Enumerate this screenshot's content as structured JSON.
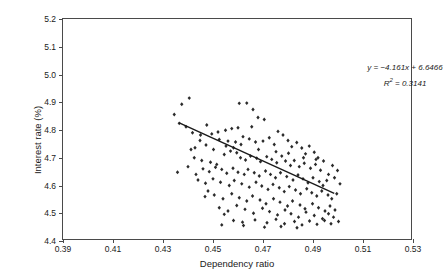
{
  "chart_data": {
    "type": "scatter",
    "title": "",
    "xlabel": "Dependency ratio",
    "ylabel": "Interest rate (%)",
    "xlim": [
      0.39,
      0.53
    ],
    "ylim": [
      4.4,
      5.2
    ],
    "xticks": [
      "0.39",
      "0.41",
      "0.43",
      "0.45",
      "0.47",
      "0.49",
      "0.51",
      "0.53"
    ],
    "xtick_values": [
      0.39,
      0.41,
      0.43,
      0.45,
      0.47,
      0.49,
      0.51,
      0.53
    ],
    "yticks": [
      "4.4",
      "4.5",
      "4.6",
      "4.7",
      "4.8",
      "4.9",
      "5.0",
      "5.1",
      "5.2"
    ],
    "ytick_values": [
      4.4,
      4.5,
      4.6,
      4.7,
      4.8,
      4.9,
      5.0,
      5.1,
      5.2
    ],
    "grid": false,
    "legend": "none",
    "marker": "filled-diamond",
    "marker_color": "#2b2b2b",
    "annotations": [
      "y = −4.161x + 6.6466",
      "R² = 0.3141"
    ],
    "equation": {
      "slope": -4.161,
      "intercept": 6.6466,
      "r_squared": 0.3141,
      "text_line1": "y = −4.161x + 6.6466",
      "text_line2_prefix": "R",
      "text_line2_sup": "2",
      "text_line2_suffix": " = 0.3141"
    },
    "trendline": {
      "color": "#1a1a1a",
      "x_start": 0.4365,
      "y_start": 4.826,
      "x_end": 0.4985,
      "y_end": 4.572
    },
    "points": [
      [
        0.4375,
        4.893
      ],
      [
        0.4405,
        4.915
      ],
      [
        0.4345,
        4.856
      ],
      [
        0.4365,
        4.824
      ],
      [
        0.4605,
        4.896
      ],
      [
        0.4635,
        4.897
      ],
      [
        0.466,
        4.874
      ],
      [
        0.468,
        4.845
      ],
      [
        0.4705,
        4.838
      ],
      [
        0.4655,
        4.812
      ],
      [
        0.46,
        4.808
      ],
      [
        0.4575,
        4.805
      ],
      [
        0.455,
        4.799
      ],
      [
        0.452,
        4.793
      ],
      [
        0.4495,
        4.786
      ],
      [
        0.4475,
        4.818
      ],
      [
        0.445,
        4.782
      ],
      [
        0.4525,
        4.766
      ],
      [
        0.456,
        4.76
      ],
      [
        0.459,
        4.757
      ],
      [
        0.462,
        4.776
      ],
      [
        0.4645,
        4.768
      ],
      [
        0.467,
        4.757
      ],
      [
        0.47,
        4.76
      ],
      [
        0.4725,
        4.772
      ],
      [
        0.4745,
        4.748
      ],
      [
        0.476,
        4.795
      ],
      [
        0.478,
        4.782
      ],
      [
        0.48,
        4.762
      ],
      [
        0.4815,
        4.74
      ],
      [
        0.4835,
        4.755
      ],
      [
        0.4855,
        4.735
      ],
      [
        0.487,
        4.714
      ],
      [
        0.4885,
        4.742
      ],
      [
        0.4905,
        4.72
      ],
      [
        0.492,
        4.7
      ],
      [
        0.4425,
        4.7
      ],
      [
        0.4455,
        4.69
      ],
      [
        0.449,
        4.684
      ],
      [
        0.4515,
        4.676
      ],
      [
        0.4545,
        4.712
      ],
      [
        0.457,
        4.724
      ],
      [
        0.4595,
        4.718
      ],
      [
        0.461,
        4.7
      ],
      [
        0.463,
        4.692
      ],
      [
        0.465,
        4.706
      ],
      [
        0.4675,
        4.698
      ],
      [
        0.469,
        4.686
      ],
      [
        0.4715,
        4.704
      ],
      [
        0.4735,
        4.694
      ],
      [
        0.4755,
        4.682
      ],
      [
        0.4775,
        4.706
      ],
      [
        0.479,
        4.688
      ],
      [
        0.481,
        4.672
      ],
      [
        0.4825,
        4.69
      ],
      [
        0.4845,
        4.668
      ],
      [
        0.4865,
        4.68
      ],
      [
        0.489,
        4.662
      ],
      [
        0.491,
        4.676
      ],
      [
        0.493,
        4.655
      ],
      [
        0.446,
        4.66
      ],
      [
        0.4485,
        4.65
      ],
      [
        0.451,
        4.666
      ],
      [
        0.4535,
        4.658
      ],
      [
        0.4555,
        4.644
      ],
      [
        0.458,
        4.662
      ],
      [
        0.46,
        4.648
      ],
      [
        0.4625,
        4.64
      ],
      [
        0.464,
        4.658
      ],
      [
        0.4665,
        4.646
      ],
      [
        0.4685,
        4.634
      ],
      [
        0.471,
        4.652
      ],
      [
        0.473,
        4.64
      ],
      [
        0.475,
        4.628
      ],
      [
        0.477,
        4.646
      ],
      [
        0.4795,
        4.632
      ],
      [
        0.482,
        4.62
      ],
      [
        0.484,
        4.638
      ],
      [
        0.486,
        4.624
      ],
      [
        0.488,
        4.61
      ],
      [
        0.49,
        4.628
      ],
      [
        0.4925,
        4.614
      ],
      [
        0.494,
        4.6
      ],
      [
        0.4955,
        4.618
      ],
      [
        0.444,
        4.62
      ],
      [
        0.447,
        4.608
      ],
      [
        0.45,
        4.624
      ],
      [
        0.453,
        4.612
      ],
      [
        0.4565,
        4.6
      ],
      [
        0.4585,
        4.618
      ],
      [
        0.4615,
        4.606
      ],
      [
        0.4645,
        4.594
      ],
      [
        0.4672,
        4.612
      ],
      [
        0.4695,
        4.598
      ],
      [
        0.472,
        4.586
      ],
      [
        0.474,
        4.604
      ],
      [
        0.4765,
        4.592
      ],
      [
        0.4785,
        4.578
      ],
      [
        0.4805,
        4.596
      ],
      [
        0.483,
        4.584
      ],
      [
        0.485,
        4.57
      ],
      [
        0.4875,
        4.588
      ],
      [
        0.4895,
        4.574
      ],
      [
        0.4915,
        4.562
      ],
      [
        0.4935,
        4.58
      ],
      [
        0.496,
        4.566
      ],
      [
        0.4975,
        4.552
      ],
      [
        0.4995,
        4.57
      ],
      [
        0.448,
        4.58
      ],
      [
        0.4505,
        4.566
      ],
      [
        0.454,
        4.552
      ],
      [
        0.4575,
        4.57
      ],
      [
        0.4605,
        4.556
      ],
      [
        0.4635,
        4.544
      ],
      [
        0.4658,
        4.562
      ],
      [
        0.4688,
        4.548
      ],
      [
        0.4712,
        4.534
      ],
      [
        0.4742,
        4.552
      ],
      [
        0.4768,
        4.54
      ],
      [
        0.4798,
        4.526
      ],
      [
        0.4818,
        4.544
      ],
      [
        0.4848,
        4.53
      ],
      [
        0.4868,
        4.516
      ],
      [
        0.4898,
        4.534
      ],
      [
        0.4922,
        4.52
      ],
      [
        0.4948,
        4.508
      ],
      [
        0.4968,
        4.526
      ],
      [
        0.4988,
        4.512
      ],
      [
        0.4525,
        4.52
      ],
      [
        0.456,
        4.508
      ],
      [
        0.4595,
        4.528
      ],
      [
        0.4628,
        4.514
      ],
      [
        0.4662,
        4.5
      ],
      [
        0.4698,
        4.518
      ],
      [
        0.4726,
        4.506
      ],
      [
        0.4758,
        4.494
      ],
      [
        0.4788,
        4.512
      ],
      [
        0.4812,
        4.498
      ],
      [
        0.4842,
        4.486
      ],
      [
        0.4872,
        4.504
      ],
      [
        0.4905,
        4.492
      ],
      [
        0.4938,
        4.48
      ],
      [
        0.4962,
        4.498
      ],
      [
        0.4982,
        4.486
      ],
      [
        0.4412,
        4.73
      ],
      [
        0.44,
        4.668
      ],
      [
        0.4358,
        4.648
      ],
      [
        0.4432,
        4.64
      ],
      [
        0.4468,
        4.56
      ],
      [
        0.4545,
        4.496
      ],
      [
        0.4582,
        4.474
      ],
      [
        0.4618,
        4.468
      ],
      [
        0.4668,
        4.476
      ],
      [
        0.4716,
        4.466
      ],
      [
        0.4752,
        4.478
      ],
      [
        0.4786,
        4.462
      ],
      [
        0.4826,
        4.47
      ],
      [
        0.4856,
        4.458
      ],
      [
        0.4886,
        4.472
      ],
      [
        0.4916,
        4.46
      ],
      [
        0.4946,
        4.474
      ],
      [
        0.4972,
        4.462
      ],
      [
        0.5002,
        4.47
      ],
      [
        0.4535,
        4.458
      ],
      [
        0.4622,
        4.456
      ],
      [
        0.4706,
        4.45
      ],
      [
        0.4772,
        4.452
      ],
      [
        0.4836,
        4.448
      ],
      [
        0.4502,
        4.73
      ],
      [
        0.4552,
        4.742
      ],
      [
        0.4472,
        4.746
      ],
      [
        0.4582,
        4.736
      ],
      [
        0.4612,
        4.748
      ],
      [
        0.4682,
        4.73
      ],
      [
        0.4752,
        4.722
      ],
      [
        0.4802,
        4.716
      ],
      [
        0.4862,
        4.7
      ],
      [
        0.4912,
        4.694
      ],
      [
        0.4942,
        4.688
      ],
      [
        0.4962,
        4.64
      ],
      [
        0.4986,
        4.628
      ],
      [
        0.5008,
        4.606
      ],
      [
        0.4998,
        4.654
      ],
      [
        0.4978,
        4.672
      ],
      [
        0.4392,
        4.812
      ],
      [
        0.4418,
        4.79
      ],
      [
        0.4448,
        4.762
      ],
      [
        0.4428,
        4.736
      ]
    ]
  }
}
